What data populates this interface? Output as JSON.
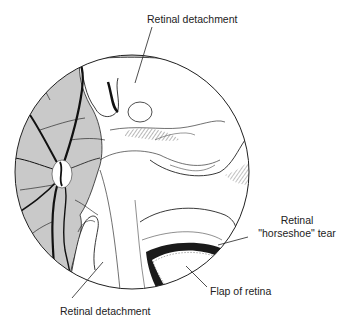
{
  "figure": {
    "labels": {
      "top_detachment": "Retinal detachment",
      "bottom_detachment": "Retinal detachment",
      "tear_line1": "Retinal",
      "tear_line2": "\"horseshoe\" tear",
      "flap": "Flap of retina"
    },
    "colors": {
      "background": "#ffffff",
      "fundus_shade": "#c9c9c9",
      "detached_retina": "#ffffff",
      "line": "#1a1a1a"
    }
  }
}
